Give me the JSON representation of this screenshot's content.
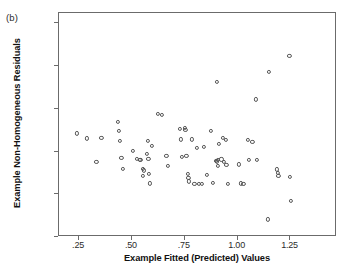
{
  "figure": {
    "panel_label": "(b)",
    "xlabel": "Example Fitted (Predicted) Values",
    "ylabel": "Example Non-Homogeneous Residuals",
    "marker_color": "#555555",
    "frame_color": "#6b6b6b",
    "background": "#ffffff"
  },
  "chart_data": {
    "type": "scatter",
    "title": "",
    "subtitle": "",
    "panel": "(b)",
    "xlabel": "Example Fitted (Predicted) Values",
    "ylabel": "Example Non-Homogeneous Residuals",
    "xlim": [
      0.155,
      1.47
    ],
    "ylim": [
      -1.0,
      1.62
    ],
    "xticks": [
      0.25,
      0.5,
      0.75,
      1.0,
      1.25
    ],
    "xtick_labels": [
      ".25",
      ".50",
      ".75",
      "1.00",
      "1.25"
    ],
    "yticks": [
      -1.0,
      -0.5,
      0.0,
      0.5,
      1.0,
      1.5
    ],
    "ytick_labels": [
      "-1.00",
      "-.50",
      ".00",
      ".50",
      "1.00",
      "1.50"
    ],
    "grid": false,
    "legend": false,
    "marker": "open-circle",
    "n_points": 84,
    "series": [
      {
        "name": "residuals",
        "points": [
          [
            0.246,
            0.2
          ],
          [
            0.291,
            0.142
          ],
          [
            0.337,
            -0.136
          ],
          [
            0.36,
            0.152
          ],
          [
            0.437,
            0.333
          ],
          [
            0.443,
            0.232
          ],
          [
            0.447,
            0.11
          ],
          [
            0.455,
            -0.089
          ],
          [
            0.462,
            -0.216
          ],
          [
            0.508,
            -0.004
          ],
          [
            0.527,
            -0.1
          ],
          [
            0.542,
            -0.112
          ],
          [
            0.545,
            -0.106
          ],
          [
            0.556,
            -0.295
          ],
          [
            0.558,
            -0.213
          ],
          [
            0.561,
            -0.232
          ],
          [
            0.576,
            -0.04
          ],
          [
            0.58,
            0.116
          ],
          [
            0.583,
            -0.1
          ],
          [
            0.585,
            -0.27
          ],
          [
            0.589,
            -0.385
          ],
          [
            0.6,
            0.05
          ],
          [
            0.627,
            0.432
          ],
          [
            0.648,
            0.415
          ],
          [
            0.668,
            -0.065
          ],
          [
            0.676,
            -0.176
          ],
          [
            0.73,
            0.256
          ],
          [
            0.736,
            0.13
          ],
          [
            0.742,
            -0.078
          ],
          [
            0.757,
            0.268
          ],
          [
            0.758,
            0.24
          ],
          [
            0.762,
            -0.062
          ],
          [
            0.768,
            -0.276
          ],
          [
            0.772,
            -0.322
          ],
          [
            0.775,
            -0.362
          ],
          [
            0.788,
            0.13
          ],
          [
            0.8,
            -0.388
          ],
          [
            0.812,
            0.03
          ],
          [
            0.823,
            -0.386
          ],
          [
            0.835,
            -0.388
          ],
          [
            0.845,
            0.042
          ],
          [
            0.858,
            -0.282
          ],
          [
            0.878,
            0.226
          ],
          [
            0.888,
            -0.382
          ],
          [
            0.902,
            -0.118
          ],
          [
            0.905,
            -0.128
          ],
          [
            0.908,
            0.8
          ],
          [
            0.91,
            -0.108
          ],
          [
            0.912,
            -0.18
          ],
          [
            0.915,
            0.078
          ],
          [
            0.928,
            -0.104
          ],
          [
            0.935,
            0.148
          ],
          [
            0.94,
            -0.13
          ],
          [
            0.948,
            0.124
          ],
          [
            0.952,
            -0.164
          ],
          [
            0.958,
            -0.388
          ],
          [
            1.01,
            -0.162
          ],
          [
            1.02,
            -0.385
          ],
          [
            1.032,
            -0.388
          ],
          [
            1.052,
            0.124
          ],
          [
            1.058,
            -0.108
          ],
          [
            1.075,
            0.1
          ],
          [
            1.09,
            0.598
          ],
          [
            1.095,
            -0.11
          ],
          [
            1.148,
            -0.805
          ],
          [
            1.152,
            0.918
          ],
          [
            1.192,
            -0.222
          ],
          [
            1.195,
            -0.262
          ],
          [
            1.198,
            -0.3
          ],
          [
            1.25,
            1.11
          ],
          [
            1.252,
            -0.31
          ],
          [
            1.255,
            -0.585
          ]
        ]
      }
    ]
  }
}
